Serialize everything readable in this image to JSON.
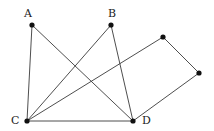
{
  "diagram": {
    "type": "graph",
    "nodes": [
      {
        "id": "A",
        "label": "A",
        "x": 32,
        "y": 25,
        "label_x": 24,
        "label_y": 17
      },
      {
        "id": "B",
        "label": "B",
        "x": 111,
        "y": 25,
        "label_x": 108,
        "label_y": 17
      },
      {
        "id": "E",
        "label": "",
        "x": 163,
        "y": 37
      },
      {
        "id": "F",
        "label": "",
        "x": 199,
        "y": 73
      },
      {
        "id": "C",
        "label": "C",
        "x": 27,
        "y": 121,
        "label_x": 11,
        "label_y": 124
      },
      {
        "id": "D",
        "label": "D",
        "x": 133,
        "y": 121,
        "label_x": 142,
        "label_y": 124
      }
    ],
    "edges": [
      {
        "from": "A",
        "to": "C"
      },
      {
        "from": "A",
        "to": "D"
      },
      {
        "from": "B",
        "to": "C"
      },
      {
        "from": "B",
        "to": "D"
      },
      {
        "from": "C",
        "to": "E"
      },
      {
        "from": "C",
        "to": "D"
      },
      {
        "from": "E",
        "to": "F"
      },
      {
        "from": "F",
        "to": "D"
      }
    ],
    "colors": {
      "edge": "#3a3a3a",
      "node": "#111111",
      "label": "#222222"
    }
  }
}
